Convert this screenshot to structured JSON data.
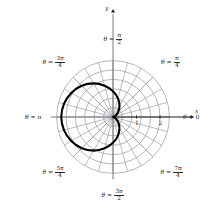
{
  "figure": {
    "kind": "polar-plot",
    "background": "#ffffff",
    "grid_color": "#8f8f95",
    "axis_color": "#1a1a1a",
    "curve_color": "#000000",
    "label_color": "#2b2b2b"
  },
  "axes": {
    "x_axis_name": "x",
    "y_axis_name": "y",
    "origin_px": [
      113,
      117
    ],
    "unit_px": 23.5
  },
  "radial_ticks": [
    {
      "label": "1",
      "value": 1
    },
    {
      "label": "2",
      "value": 2
    }
  ],
  "angle_labels": [
    {
      "id": "theta-0",
      "theta_deg": 0,
      "prefix": "θ =",
      "whole": "0",
      "num": "",
      "den": ""
    },
    {
      "id": "theta-pi-4",
      "theta_deg": 45,
      "prefix": "θ =",
      "whole": "",
      "num": "π",
      "den": "4"
    },
    {
      "id": "theta-pi-2",
      "theta_deg": 90,
      "prefix": "θ =",
      "whole": "",
      "num": "π",
      "den": "2"
    },
    {
      "id": "theta-3pi-4",
      "theta_deg": 135,
      "prefix": "θ =",
      "whole": "",
      "num": "3π",
      "den": "4"
    },
    {
      "id": "theta-pi",
      "theta_deg": 180,
      "prefix": "θ =",
      "whole": "π",
      "num": "",
      "den": ""
    },
    {
      "id": "theta-5pi-4",
      "theta_deg": 225,
      "prefix": "θ =",
      "whole": "",
      "num": "5π",
      "den": "4"
    },
    {
      "id": "theta-3pi-2",
      "theta_deg": 270,
      "prefix": "θ =",
      "whole": "",
      "num": "3π",
      "den": "2"
    },
    {
      "id": "theta-7pi-4",
      "theta_deg": 315,
      "prefix": "θ =",
      "whole": "",
      "num": "7π",
      "den": "4"
    }
  ],
  "chart_data": {
    "type": "line",
    "coordinate_system": "polar",
    "title": "",
    "xlabel": "x",
    "ylabel": "y",
    "grid": true,
    "legend": null,
    "rlim": [
      0,
      2.4
    ],
    "theta_tick_labels": [
      "θ = 0",
      "θ = π/4",
      "θ = π/2",
      "θ = 3π/4",
      "θ = π",
      "θ = 5π/4",
      "θ = 3π/2",
      "θ = 7π/4"
    ],
    "r_tick_labels": [
      "1",
      "2"
    ],
    "grid_circle_radii": [
      0.4,
      0.8,
      1.2,
      1.6,
      2.0,
      2.4
    ],
    "grid_spoke_count": 24,
    "series": [
      {
        "name": "cardioid",
        "equation": "r = 1.1(1 - cos θ)",
        "amplitude": 1.1,
        "r_max": 2.2,
        "cusp_theta_deg": 0,
        "opens": "left",
        "points_polar": [
          {
            "theta_deg": 0,
            "r": 0.0
          },
          {
            "theta_deg": 15,
            "r": 0.04
          },
          {
            "theta_deg": 30,
            "r": 0.15
          },
          {
            "theta_deg": 45,
            "r": 0.32
          },
          {
            "theta_deg": 60,
            "r": 0.55
          },
          {
            "theta_deg": 75,
            "r": 0.82
          },
          {
            "theta_deg": 90,
            "r": 1.1
          },
          {
            "theta_deg": 105,
            "r": 1.38
          },
          {
            "theta_deg": 120,
            "r": 1.65
          },
          {
            "theta_deg": 135,
            "r": 1.88
          },
          {
            "theta_deg": 150,
            "r": 2.05
          },
          {
            "theta_deg": 165,
            "r": 2.16
          },
          {
            "theta_deg": 180,
            "r": 2.2
          },
          {
            "theta_deg": 195,
            "r": 2.16
          },
          {
            "theta_deg": 210,
            "r": 2.05
          },
          {
            "theta_deg": 225,
            "r": 1.88
          },
          {
            "theta_deg": 240,
            "r": 1.65
          },
          {
            "theta_deg": 255,
            "r": 1.38
          },
          {
            "theta_deg": 270,
            "r": 1.1
          },
          {
            "theta_deg": 285,
            "r": 0.82
          },
          {
            "theta_deg": 300,
            "r": 0.55
          },
          {
            "theta_deg": 315,
            "r": 0.32
          },
          {
            "theta_deg": 330,
            "r": 0.15
          },
          {
            "theta_deg": 345,
            "r": 0.04
          },
          {
            "theta_deg": 360,
            "r": 0.0
          }
        ]
      }
    ]
  }
}
